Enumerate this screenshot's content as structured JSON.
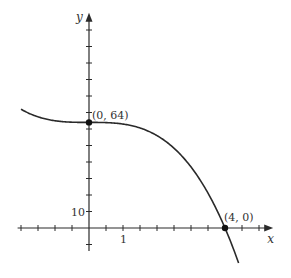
{
  "chart_data": {
    "type": "line",
    "title": "",
    "xlabel": "x",
    "ylabel": "y",
    "function": "y = 64 - x^3",
    "xlim": [
      -2.0,
      4.4
    ],
    "ylim": [
      -20,
      128
    ],
    "x_axis_range": [
      -2.1,
      5.3
    ],
    "y_axis_range": [
      -14,
      128
    ],
    "x_tick_step": 0.5,
    "y_tick_step": 10,
    "x_tick_labels": [
      {
        "value": 1,
        "label": "1"
      }
    ],
    "y_tick_labels": [
      {
        "value": 10,
        "label": "10"
      }
    ],
    "grid": false,
    "series": [
      {
        "name": "f(x)",
        "x": [
          -2.0,
          -1.5,
          -1.0,
          -0.5,
          0.0,
          0.5,
          1.0,
          1.5,
          2.0,
          2.5,
          3.0,
          3.5,
          4.0,
          4.4
        ],
        "y": [
          72,
          67.375,
          65,
          64.125,
          64,
          63.875,
          63,
          60.625,
          56,
          48.375,
          37,
          21.125,
          0,
          -21.18
        ]
      }
    ],
    "annotations": [
      {
        "x": 0,
        "y": 64,
        "label": "(0, 64)",
        "marker": "dot"
      },
      {
        "x": 4,
        "y": 0,
        "label": "(4, 0)",
        "marker": "dot"
      }
    ]
  }
}
